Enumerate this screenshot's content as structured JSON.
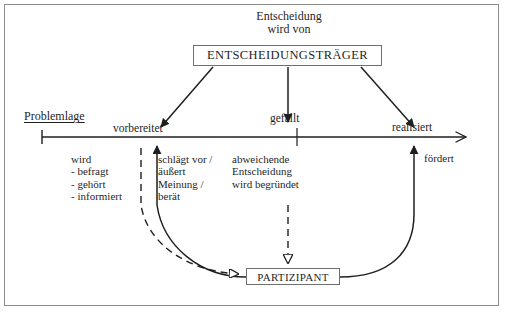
{
  "diagram": {
    "title_caption": "Entscheidung\nwird von",
    "decider_node": "ENTSCHEIDUNGSTRÄGER",
    "participant_node": "PARTIZIPANT",
    "axis_start_label": "Problemlage",
    "stages": [
      {
        "id": "vorbereitet",
        "label": "vorbereitet"
      },
      {
        "id": "gefaellt",
        "label": "gefällt"
      },
      {
        "id": "realisiert",
        "label": "realisiert"
      }
    ],
    "annotations": {
      "participant_passive": "wird\n- befragt\n- gehört\n- informiert",
      "participant_active": "schlägt vor /\näußert\nMeinung /\nberät",
      "deviation_note": "abweichende\nEntscheidung\nwird begründet",
      "promotes": "fördert"
    },
    "colors": {
      "ink": "#1f1f1f",
      "frame": "#8d8d8d",
      "box_border": "#6f6f6f",
      "background": "#ffffff"
    }
  }
}
